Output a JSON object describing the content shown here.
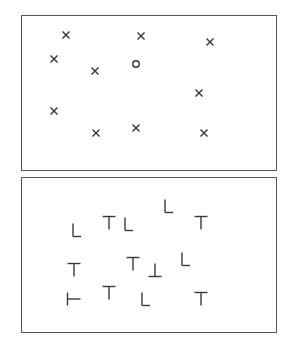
{
  "colors": {
    "stroke": "#3a3a3a",
    "border": "#555555",
    "background": "#ffffff"
  },
  "panels": [
    {
      "name": "feature-search-panel",
      "box": {
        "x": 21,
        "y": 15,
        "w": 256,
        "h": 156
      },
      "description": "Field of X distractors with a single O target",
      "items": [
        {
          "glyph": "x",
          "x": 65,
          "y": 34
        },
        {
          "glyph": "x",
          "x": 140,
          "y": 35
        },
        {
          "glyph": "x",
          "x": 209,
          "y": 41
        },
        {
          "glyph": "x",
          "x": 53,
          "y": 58
        },
        {
          "glyph": "x",
          "x": 94,
          "y": 70
        },
        {
          "glyph": "o",
          "x": 135,
          "y": 63
        },
        {
          "glyph": "x",
          "x": 198,
          "y": 92
        },
        {
          "glyph": "x",
          "x": 53,
          "y": 110
        },
        {
          "glyph": "x",
          "x": 95,
          "y": 132
        },
        {
          "glyph": "x",
          "x": 135,
          "y": 127
        },
        {
          "glyph": "x",
          "x": 203,
          "y": 132
        }
      ]
    },
    {
      "name": "conjunction-search-panel",
      "box": {
        "x": 21,
        "y": 177,
        "w": 256,
        "h": 156
      },
      "description": "Field of T and L shapes in various orientations",
      "items": [
        {
          "glyph": "L",
          "rotation": 0,
          "x": 76,
          "y": 229
        },
        {
          "glyph": "T",
          "rotation": 0,
          "x": 108,
          "y": 222
        },
        {
          "glyph": "L",
          "rotation": 0,
          "x": 128,
          "y": 223
        },
        {
          "glyph": "L",
          "rotation": 0,
          "x": 168,
          "y": 205
        },
        {
          "glyph": "T",
          "rotation": 0,
          "x": 200,
          "y": 222
        },
        {
          "glyph": "T",
          "rotation": 0,
          "x": 73,
          "y": 269
        },
        {
          "glyph": "T",
          "rotation": 0,
          "x": 132,
          "y": 263
        },
        {
          "glyph": "T",
          "rotation": 180,
          "x": 154,
          "y": 269
        },
        {
          "glyph": "L",
          "rotation": 0,
          "x": 185,
          "y": 258
        },
        {
          "glyph": "T",
          "rotation": 270,
          "x": 73,
          "y": 298
        },
        {
          "glyph": "T",
          "rotation": 0,
          "x": 108,
          "y": 292
        },
        {
          "glyph": "L",
          "rotation": 0,
          "x": 145,
          "y": 298
        },
        {
          "glyph": "T",
          "rotation": 0,
          "x": 200,
          "y": 298
        }
      ]
    }
  ]
}
